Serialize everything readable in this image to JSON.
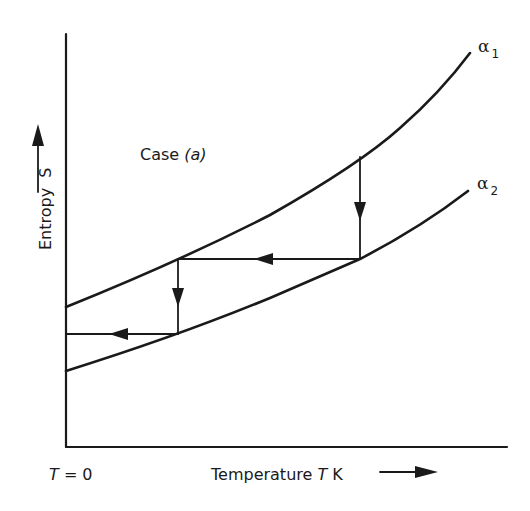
{
  "diagram": {
    "title": "Case (a)",
    "case_label": "Case",
    "case_var": "(a)",
    "y_axis": {
      "label": "Entropy",
      "symbol": "S",
      "arrow": "arrow-up-icon"
    },
    "x_axis": {
      "label": "Temperature",
      "symbol": "T",
      "unit": "K",
      "arrow": "arrow-right-icon"
    },
    "origin_label": {
      "symbol": "T",
      "text": "= 0"
    },
    "curves": [
      {
        "name": "α",
        "subscript": "1",
        "description": "upper entropy curve"
      },
      {
        "name": "α",
        "subscript": "2",
        "description": "lower entropy curve"
      }
    ],
    "steps": [
      "vertical step from α1 down to α2 (isothermal)",
      "horizontal step left along α2 level to α1 (adiabatic)",
      "vertical step from α1 down to α2 (isothermal)",
      "horizontal step left toward T = 0 axis (adiabatic)"
    ],
    "stroke_color": "#1a1a1a",
    "background": "#ffffff"
  }
}
